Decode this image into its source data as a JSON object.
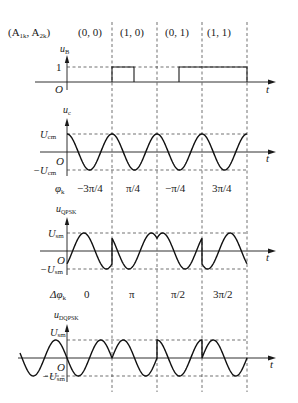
{
  "header": {
    "symbol_label": "(A",
    "symbol_sub1": "1k",
    "symbol_sep": ", A",
    "symbol_sub2": "2k",
    "symbol_close": ")",
    "pairs": [
      "(0, 0)",
      "(1, 0)",
      "(0, 1)",
      "(1, 1)"
    ]
  },
  "panel_baseband": {
    "ylabel": "u",
    "ylabel_sub": "B",
    "level_one": "1",
    "origin": "O",
    "xlabel": "t"
  },
  "panel_carrier": {
    "ylabel": "u",
    "ylabel_sub": "c",
    "top": "U",
    "top_sub": "cm",
    "bottom": "−U",
    "bottom_sub": "cm",
    "origin": "O",
    "xlabel": "t",
    "phase_label": "φ",
    "phase_sub": "k",
    "phases": [
      "−3π/4",
      "π/4",
      "−π/4",
      "3π/4"
    ]
  },
  "panel_qpsk": {
    "ylabel": "u",
    "ylabel_sub": "QPSK",
    "top": "U",
    "top_sub": "sm",
    "bottom": "−U",
    "bottom_sub": "sm",
    "origin": "O",
    "xlabel": "t",
    "dphase_label": "Δφ",
    "dphase_sub": "k",
    "dphases": [
      "0",
      "π",
      "π/2",
      "3π/2"
    ]
  },
  "panel_dqpsk": {
    "ylabel": "u",
    "ylabel_sub": "DQPSK",
    "top": "U",
    "top_sub": "sm",
    "bottom": "−U",
    "bottom_sub": "sm",
    "origin": "O",
    "xlabel": "t"
  },
  "geometry": {
    "y_axis_x": 67,
    "dividers_x": [
      112,
      157,
      202,
      247
    ],
    "symbol_period_px": 45,
    "baseband_bits": [
      0,
      1,
      0,
      1
    ],
    "baseband_note": "pulse 112-135 and 179-247",
    "qpsk_phases_rad": [
      -2.356,
      0.785,
      -0.785,
      2.356
    ],
    "dqpsk_phases_rad": [
      1.571,
      4.712,
      6.283,
      10.996
    ]
  }
}
